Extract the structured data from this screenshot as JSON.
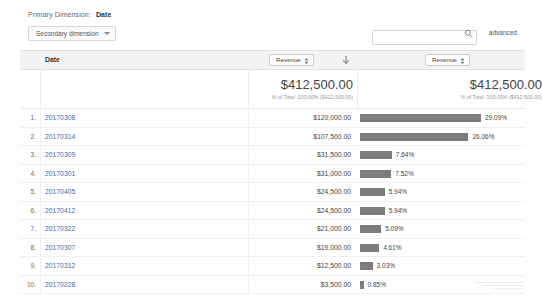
{
  "toolbar": {
    "primary_dimension_label": "Primary Dimension:",
    "primary_dimension_value": "Date",
    "secondary_dimension_label": "Secondary dimension",
    "search_placeholder": "",
    "search_value": "",
    "advanced_label": "advanced",
    "search_icon": "search-icon"
  },
  "table": {
    "date_column_header": "Date",
    "metric_select_first": "Revenue",
    "metric_select_second": "Revenue",
    "sort_icon": "sort-descending-arrow-icon",
    "totals": {
      "left_amount": "$412,500.00",
      "left_sub": "% of Total: 100.00% ($412,500.00)",
      "right_amount": "$412,500.00",
      "right_sub": "% of Total: 100.00% ($412,500.00)"
    },
    "rows": [
      {
        "index": "1.",
        "date": "20170308",
        "value": "$120,000.00",
        "percent": "29.09%",
        "pct_num": 29.09
      },
      {
        "index": "2.",
        "date": "20170314",
        "value": "$107,500.00",
        "percent": "26.06%",
        "pct_num": 26.06
      },
      {
        "index": "3.",
        "date": "20170309",
        "value": "$31,500.00",
        "percent": "7.64%",
        "pct_num": 7.64
      },
      {
        "index": "4.",
        "date": "20170301",
        "value": "$31,000.00",
        "percent": "7.52%",
        "pct_num": 7.52
      },
      {
        "index": "5.",
        "date": "20170405",
        "value": "$24,500.00",
        "percent": "5.94%",
        "pct_num": 5.94
      },
      {
        "index": "6.",
        "date": "20170412",
        "value": "$24,500.00",
        "percent": "5.94%",
        "pct_num": 5.94
      },
      {
        "index": "7.",
        "date": "20170322",
        "value": "$21,000.00",
        "percent": "5.09%",
        "pct_num": 5.09
      },
      {
        "index": "8.",
        "date": "20170307",
        "value": "$19,000.00",
        "percent": "4.61%",
        "pct_num": 4.61
      },
      {
        "index": "9.",
        "date": "20170312",
        "value": "$12,500.00",
        "percent": "3.03%",
        "pct_num": 3.03
      },
      {
        "index": "10.",
        "date": "20170228",
        "value": "$3,500.00",
        "percent": "0.85%",
        "pct_num": 0.85
      }
    ]
  },
  "chart_data": {
    "type": "bar",
    "categories": [
      "20170308",
      "20170314",
      "20170309",
      "20170301",
      "20170405",
      "20170412",
      "20170322",
      "20170307",
      "20170312",
      "20170228"
    ],
    "values": [
      120000,
      107500,
      31500,
      31000,
      24500,
      24500,
      21000,
      19000,
      12500,
      3500
    ],
    "percent_of_total": [
      29.09,
      26.06,
      7.64,
      7.52,
      5.94,
      5.94,
      5.09,
      4.61,
      3.03,
      0.85
    ],
    "total": 412500,
    "xlabel": "Date",
    "ylabel": "Revenue",
    "orientation": "horizontal",
    "grid": false,
    "legend": "none",
    "bar_color": "#7c7c7c"
  },
  "style": {
    "bar_color": "#7c7c7c",
    "header_bg": "#f3f3f3",
    "link_color": "#3b6ea8"
  }
}
